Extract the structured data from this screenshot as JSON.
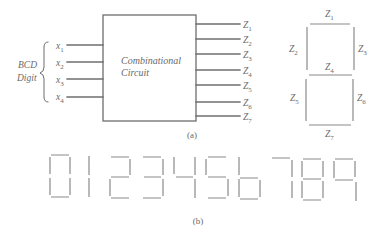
{
  "figure_a": {
    "caption": "(a)",
    "group_label_line1": "BCD",
    "group_label_line2": "Digit",
    "block_label_line1": "Combinational",
    "block_label_line2": "Circuit",
    "inputs": [
      {
        "var": "x",
        "sub": "1"
      },
      {
        "var": "x",
        "sub": "2"
      },
      {
        "var": "x",
        "sub": "3"
      },
      {
        "var": "x",
        "sub": "4"
      }
    ],
    "outputs": [
      {
        "var": "Z",
        "sub": "1"
      },
      {
        "var": "Z",
        "sub": "2"
      },
      {
        "var": "Z",
        "sub": "3"
      },
      {
        "var": "Z",
        "sub": "4"
      },
      {
        "var": "Z",
        "sub": "5"
      },
      {
        "var": "Z",
        "sub": "6"
      },
      {
        "var": "Z",
        "sub": "7"
      }
    ],
    "segment_labels": {
      "top": {
        "var": "Z",
        "sub": "1"
      },
      "upper_left": {
        "var": "Z",
        "sub": "2"
      },
      "upper_right": {
        "var": "Z",
        "sub": "3"
      },
      "middle": {
        "var": "Z",
        "sub": "4"
      },
      "lower_left": {
        "var": "Z",
        "sub": "5"
      },
      "lower_right": {
        "var": "Z",
        "sub": "6"
      },
      "bottom": {
        "var": "Z",
        "sub": "7"
      }
    }
  },
  "figure_b": {
    "caption": "(b)",
    "digits": [
      "0",
      "1",
      "2",
      "3",
      "4",
      "5",
      "6",
      "7",
      "8",
      "9"
    ]
  }
}
